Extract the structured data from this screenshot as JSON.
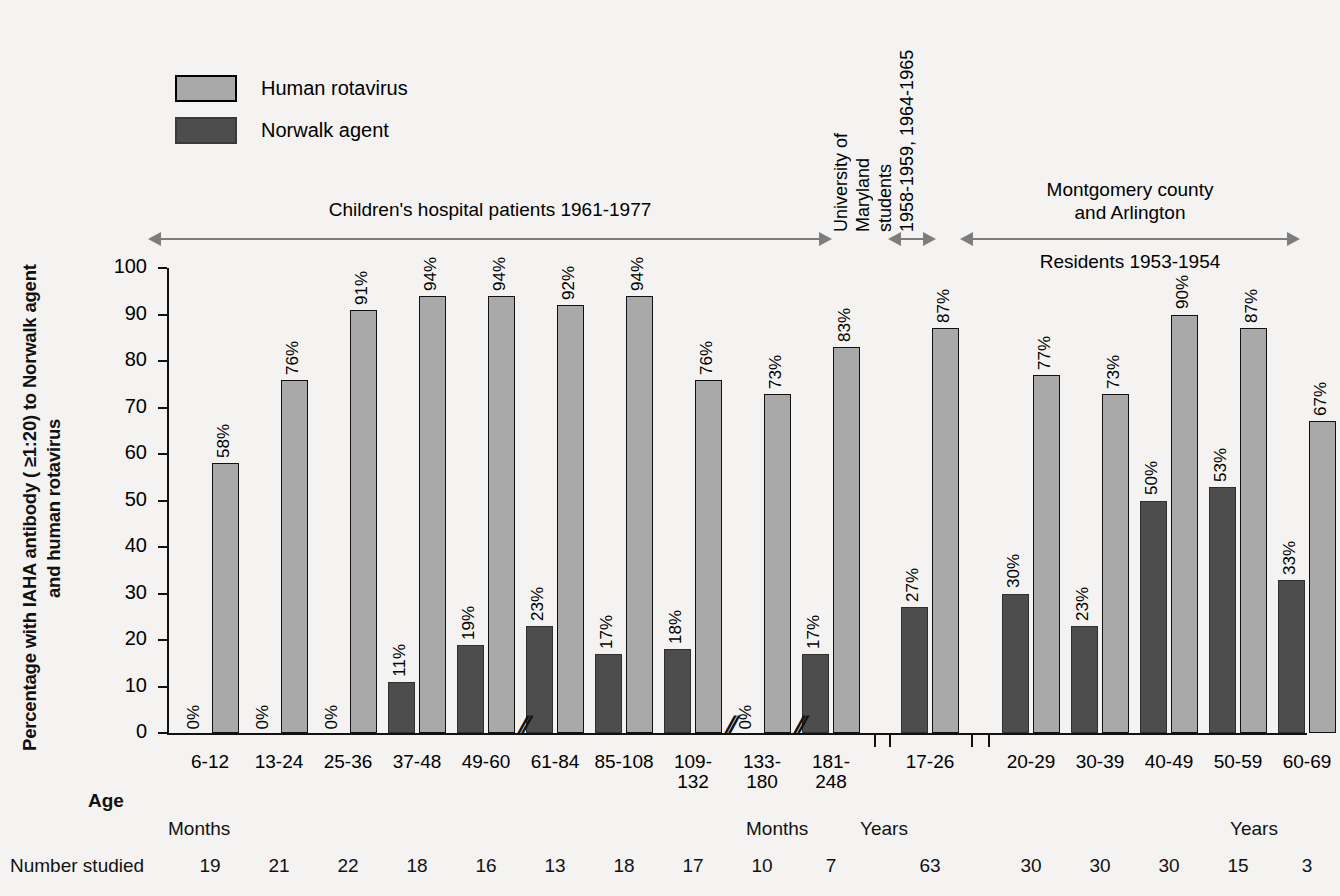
{
  "legend": {
    "items": [
      {
        "label": "Human rotavirus",
        "color": "#a9a9a9",
        "key": "human-rotavirus"
      },
      {
        "label": "Norwalk agent",
        "color": "#4d4d4d",
        "key": "norwalk-agent"
      }
    ]
  },
  "axes": {
    "y_title": "Percentage with IAHA antibody ( ≥1:20) to Norwalk agent and human rotavirus",
    "y_ticks": [
      "100",
      "90",
      "80",
      "70",
      "60",
      "50",
      "40",
      "30",
      "20",
      "10",
      "0"
    ],
    "age_label": "Age",
    "number_studied_label": "Number studied",
    "unit_months_left": "Months",
    "unit_months_right": "Months",
    "unit_years_mid": "Years",
    "unit_years_right": "Years"
  },
  "annotations": [
    {
      "key": "childrens-hospital",
      "text": "Children's hospital patients 1961-1977",
      "orientation": "horizontal"
    },
    {
      "key": "university-maryland",
      "lines": [
        "University of",
        "Maryland",
        "students",
        "1958-1959, 1964-1965"
      ],
      "orientation": "vertical"
    },
    {
      "key": "montgomery-arlington",
      "line1": "Montgomery county",
      "line2": "and Arlington",
      "line3": "Residents 1953-1954",
      "orientation": "horizontal"
    }
  ],
  "chart_data": {
    "type": "bar",
    "title": "",
    "xlabel": "Age",
    "ylabel": "Percentage with IAHA antibody ( ≥1:20) to Norwalk agent and human rotavirus",
    "ylim": [
      0,
      100
    ],
    "ytick_step": 10,
    "grid": false,
    "legend_position": "top-left",
    "categories": [
      "6-12",
      "13-24",
      "25-36",
      "37-48",
      "49-60",
      "61-84",
      "85-108",
      "109-132",
      "133-180",
      "181-248",
      "17-26",
      "20-29",
      "30-39",
      "40-49",
      "50-59",
      "60-69"
    ],
    "category_units": [
      "Months",
      "Months",
      "Months",
      "Months",
      "Months",
      "Months",
      "Months",
      "Months",
      "Months",
      "Months",
      "Years",
      "Years",
      "Years",
      "Years",
      "Years",
      "Years"
    ],
    "series": [
      {
        "name": "Norwalk agent",
        "color": "#4d4d4d",
        "values": [
          0,
          0,
          0,
          11,
          19,
          23,
          17,
          18,
          0,
          17,
          27,
          30,
          23,
          50,
          53,
          33
        ],
        "labels": [
          "0%",
          "0%",
          "0%",
          "11%",
          "19%",
          "23%",
          "17%",
          "18%",
          "0%",
          "17%",
          "27%",
          "30%",
          "23%",
          "50%",
          "53%",
          "33%"
        ]
      },
      {
        "name": "Human rotavirus",
        "color": "#a9a9a9",
        "values": [
          58,
          76,
          91,
          94,
          94,
          92,
          94,
          76,
          73,
          83,
          87,
          77,
          73,
          90,
          87,
          67
        ],
        "labels": [
          "58%",
          "76%",
          "91%",
          "94%",
          "94%",
          "92%",
          "94%",
          "76%",
          "73%",
          "83%",
          "87%",
          "77%",
          "73%",
          "90%",
          "87%",
          "67%"
        ]
      }
    ],
    "number_studied": [
      19,
      21,
      22,
      18,
      16,
      13,
      18,
      17,
      10,
      7,
      63,
      30,
      30,
      30,
      15,
      3
    ],
    "axis_breaks_after": [
      "49-60",
      "109-132",
      "133-180"
    ],
    "panel_groups": [
      {
        "label": "Children's hospital patients 1961-1977",
        "categories": [
          "6-12",
          "13-24",
          "25-36",
          "37-48",
          "49-60",
          "61-84",
          "85-108",
          "109-132",
          "133-180",
          "181-248"
        ]
      },
      {
        "label": "University of Maryland students 1958-1959, 1964-1965",
        "categories": [
          "17-26"
        ]
      },
      {
        "label": "Montgomery county and Arlington Residents 1953-1954",
        "categories": [
          "20-29",
          "30-39",
          "40-49",
          "50-59",
          "60-69"
        ]
      }
    ]
  }
}
